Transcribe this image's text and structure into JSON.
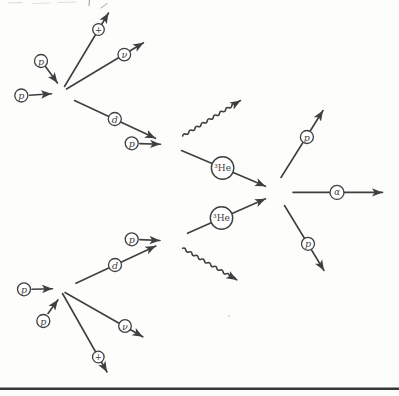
{
  "colors": {
    "ink": "#3f3f3f",
    "paper": "#fdfdfc",
    "rule": "#383838"
  },
  "particles": {
    "proton": "p",
    "deuteron": "d",
    "neutrino": "ν",
    "positron": "+",
    "helium3": "³He",
    "alpha": "α"
  }
}
